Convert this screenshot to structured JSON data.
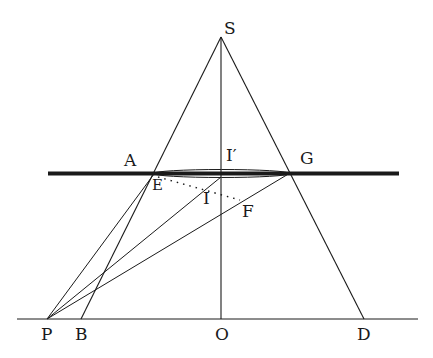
{
  "diagram": {
    "colors": {
      "line": "#1a1a1a",
      "background": "#ffffff"
    },
    "labels": {
      "S": "S",
      "A": "A",
      "I_prime": "I′",
      "G": "G",
      "E": "E",
      "I": "I",
      "F": "F",
      "P": "P",
      "B": "B",
      "O": "O",
      "D": "D"
    },
    "points": {
      "S": [
        221,
        37
      ],
      "A": [
        153,
        173
      ],
      "E": [
        155,
        177
      ],
      "I_prime": [
        221,
        173
      ],
      "I": [
        222,
        192
      ],
      "G": [
        290,
        173
      ],
      "F": [
        240,
        204
      ],
      "P": [
        47,
        319
      ],
      "B": [
        81,
        319
      ],
      "O": [
        221,
        319
      ],
      "D": [
        364,
        319
      ]
    },
    "elements": [
      "thick horizontal plane line through A and G",
      "ground line through P, B, O, D",
      "cone edges S-B and S-D",
      "axis S-O",
      "lens ellipse between A and G",
      "rays P-E, P-I, P-G, B-E",
      "dotted segment E-F"
    ]
  }
}
